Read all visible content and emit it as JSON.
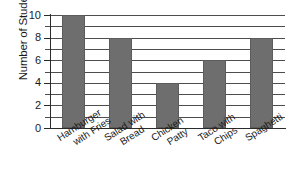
{
  "chart_data": {
    "type": "bar",
    "title": "",
    "xlabel": "",
    "ylabel": "Number of Students",
    "categories": [
      "Hamburger with Fries",
      "Salad with Bread",
      "Chicken Patty",
      "Taco with Chips",
      "Spaghetti"
    ],
    "category_lines": [
      [
        "Hamburger",
        "with Fries"
      ],
      [
        "Salad with",
        "Bread"
      ],
      [
        "Chicken",
        "Patty"
      ],
      [
        "Taco with",
        "Chips"
      ],
      [
        "Spaghetti",
        ""
      ]
    ],
    "values": [
      10,
      8,
      4,
      6,
      8
    ],
    "ylim": [
      0,
      10
    ],
    "ytick_labels": [
      "0",
      "2",
      "4",
      "6",
      "8",
      "10"
    ],
    "ytick_values": [
      0,
      2,
      4,
      6,
      8,
      10
    ],
    "minor_tick_values": [
      1,
      3,
      5,
      7,
      9
    ],
    "gridline_values": [
      1,
      2,
      3,
      4,
      5,
      6,
      7,
      8,
      9,
      10
    ],
    "grid": true,
    "legend": "none",
    "bar_color": "#6e6e6e",
    "grid_color": "#4d4d4d",
    "axis_color": "#2b2b2b",
    "background_color": "#ffffff"
  }
}
